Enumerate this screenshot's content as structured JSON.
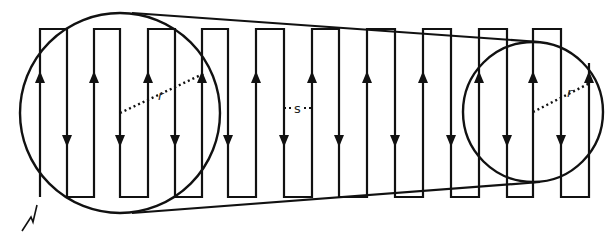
{
  "diagram": {
    "colors": {
      "stroke": "#111111",
      "background": "#ffffff"
    },
    "serpentine": {
      "top_y": 29,
      "bottom_y": 197,
      "verticals_x": [
        40,
        67,
        94,
        120,
        148,
        175,
        202,
        228,
        256,
        284,
        312,
        339,
        367,
        395,
        423,
        451,
        479,
        507,
        533,
        561,
        589
      ],
      "start_open_end": "bottom",
      "end_top_y": 63,
      "up_arrow_y": 78,
      "down_arrow_y": 140
    },
    "circles": [
      {
        "name": "large-circle",
        "cx": 120,
        "cy": 113,
        "r": 100
      },
      {
        "name": "small-circle",
        "cx": 533,
        "cy": 112,
        "r": 70
      }
    ],
    "tangents": [
      {
        "x1": 132,
        "y1": 13,
        "x2": 540,
        "y2": 42
      },
      {
        "x1": 132,
        "y1": 213,
        "x2": 540,
        "y2": 182
      }
    ],
    "labels": {
      "radius_large": "r",
      "radius_small": "r",
      "spacing": "s"
    },
    "radius_lines": [
      {
        "x1": 120,
        "y1": 113,
        "x2": 205,
        "y2": 73
      },
      {
        "x1": 533,
        "y1": 112,
        "x2": 590,
        "y2": 83
      }
    ],
    "spacing_line": {
      "x1": 284,
      "x2": 312,
      "y": 108
    }
  }
}
